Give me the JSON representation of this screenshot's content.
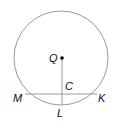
{
  "diagram": {
    "type": "circle-geometry",
    "colors": {
      "circle": "#9a9a9a",
      "lines": "#9a9a9a",
      "point": "#000000",
      "label": "#111111"
    },
    "circle": {
      "center": "Q",
      "cx": 61,
      "cy": 58,
      "r": 47
    },
    "points": [
      {
        "id": "Q",
        "label": "Q",
        "x": 62,
        "y": 58,
        "lx": 49,
        "ly": 62
      },
      {
        "id": "C",
        "label": "C",
        "x": 62,
        "y": 94,
        "lx": 65,
        "ly": 90
      },
      {
        "id": "M",
        "label": "M",
        "x": 25,
        "y": 94,
        "lx": 13,
        "ly": 102
      },
      {
        "id": "K",
        "label": "K",
        "x": 97,
        "y": 94,
        "lx": 98,
        "ly": 102
      },
      {
        "id": "L",
        "label": "L",
        "x": 62,
        "y": 105,
        "lx": 57,
        "ly": 117
      }
    ],
    "segments": [
      {
        "from": "M",
        "to": "K"
      },
      {
        "from": "Q",
        "to": "L"
      }
    ]
  }
}
